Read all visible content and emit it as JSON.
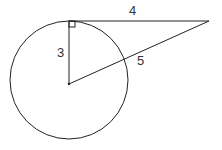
{
  "diagram": {
    "labels": {
      "tangent_length": "4",
      "radius": "3",
      "hypotenuse": "5"
    },
    "stroke_color": "#222222"
  }
}
